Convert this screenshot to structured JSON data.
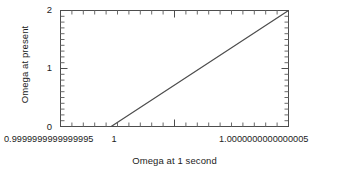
{
  "chart_data": {
    "type": "line",
    "title": "",
    "xlabel": "Omega at 1 second",
    "ylabel": "Omega at present",
    "xlim": [
      0.9999999999999994,
      1.0000000000000004
    ],
    "ylim": [
      0,
      2
    ],
    "grid": false,
    "legend": null,
    "xtick_labels": [
      "0.9999999999999995",
      "1",
      "1.0000000000000005"
    ],
    "xtick_values": [
      0.9999999999999994,
      1.0,
      1.0000000000000004
    ],
    "ytick_labels": [
      "0",
      "1",
      "2"
    ],
    "ytick_values": [
      0,
      1,
      2
    ],
    "y_minor_tick_step": 0.1,
    "x_minor_tick_count": 9,
    "line_color": "#4d4d4d",
    "series": [
      {
        "name": "Omega evolution",
        "x": [
          0.9999999999999997,
          1.0000000000000004
        ],
        "y": [
          0,
          2
        ]
      }
    ]
  },
  "axes": {
    "y_title": "Omega at present",
    "x_title": "Omega at 1 second",
    "y_ticks": [
      {
        "label": "2",
        "value": 2
      },
      {
        "label": "1",
        "value": 1
      },
      {
        "label": "0",
        "value": 0
      }
    ],
    "x_ticks": [
      {
        "label": "0.9999999999999995",
        "value": 0.9999999999999994
      },
      {
        "label": "1",
        "value": 1.0
      },
      {
        "label": "1.0000000000000005",
        "value": 1.0000000000000004
      }
    ]
  }
}
